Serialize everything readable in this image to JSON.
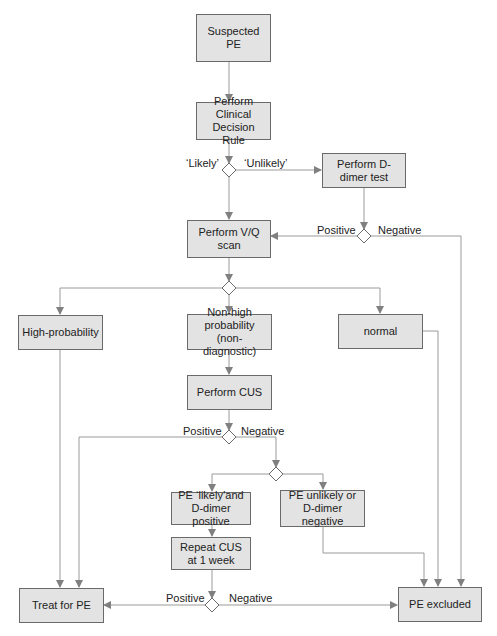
{
  "diagram": {
    "type": "flowchart",
    "colors": {
      "box_fill": "#e3e3e3",
      "box_border": "#6a6a6a",
      "connector": "#9a9a9a",
      "text": "#222222"
    },
    "nodes": {
      "suspected_pe": "Suspected PE",
      "clinical_rule": "Perform Clinical Decision Rule",
      "ddimer": "Perform D-dimer test",
      "vq_scan": "Perform V/Q scan",
      "high_prob": "High-probability",
      "non_high": "Non-high probability (non-diagnostic)",
      "normal": "normal",
      "perform_cus": "Perform CUS",
      "pe_likely": "PE ‘likely’and D-dimer positive",
      "pe_unlikely": "PE unlikely or D-dimer negative",
      "repeat_cus": "Repeat CUS at 1 week",
      "treat": "Treat for PE",
      "excluded": "PE excluded"
    },
    "labels": {
      "likely": "‘Likely’",
      "unlikely": "‘Unlikely’",
      "dd_positive": "Positive",
      "dd_negative": "Negative",
      "cus_positive": "Positive",
      "cus_negative": "Negative",
      "repeat_positive": "Positive",
      "repeat_negative": "Negative"
    }
  }
}
